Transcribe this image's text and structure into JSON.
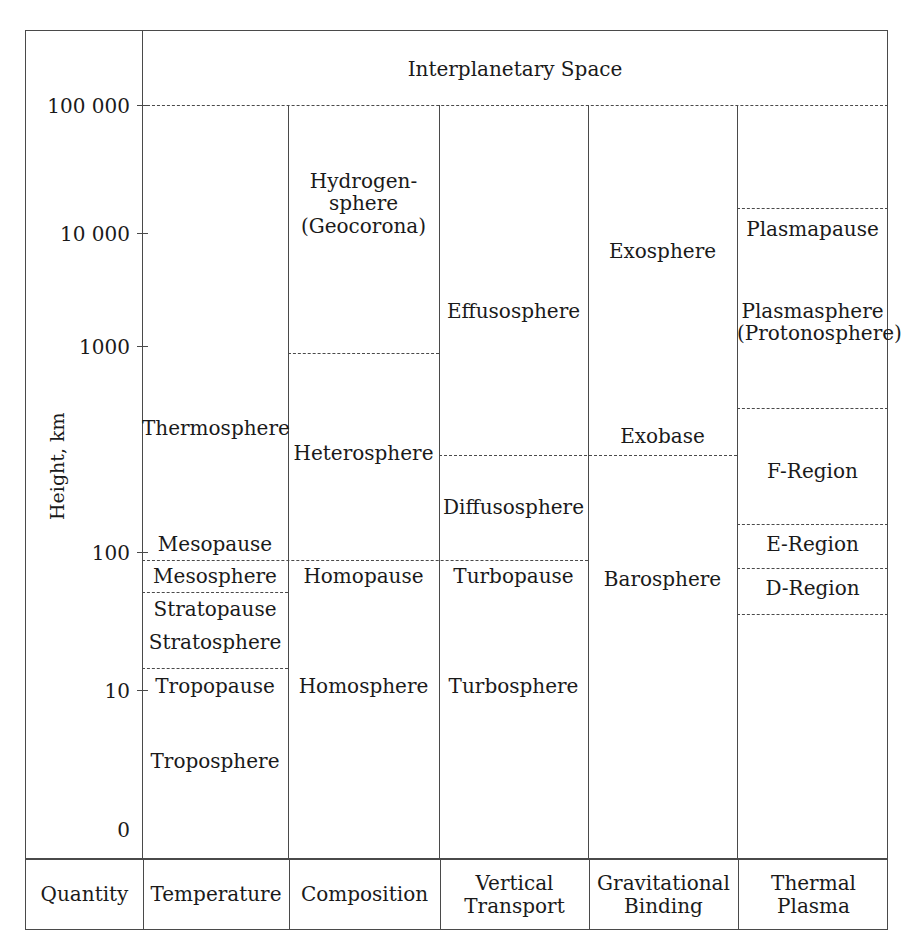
{
  "figure": {
    "axis_title": "Height, km",
    "top_banner": "Interplanetary Space"
  },
  "axis": {
    "ticks": [
      {
        "label": "100 000",
        "value": 100000
      },
      {
        "label": "10 000",
        "value": 10000
      },
      {
        "label": "1000",
        "value": 1000
      },
      {
        "label": "100",
        "value": 100
      },
      {
        "label": "10",
        "value": 10
      },
      {
        "label": "0",
        "value": 0
      }
    ]
  },
  "columns": [
    {
      "key": "quantity",
      "header": "Quantity"
    },
    {
      "key": "temperature",
      "header": "Temperature"
    },
    {
      "key": "composition",
      "header": "Composition"
    },
    {
      "key": "vertical_transport",
      "header": "Vertical\nTransport"
    },
    {
      "key": "gravitational_binding",
      "header": "Gravitational\nBinding"
    },
    {
      "key": "thermal_plasma",
      "header": "Thermal\nPlasma"
    }
  ],
  "regions": {
    "temperature": [
      {
        "label": "Thermosphere"
      },
      {
        "label": "Mesopause"
      },
      {
        "label": "Mesosphere"
      },
      {
        "label": "Stratopause"
      },
      {
        "label": "Stratosphere"
      },
      {
        "label": "Tropopause"
      },
      {
        "label": "Troposphere"
      }
    ],
    "composition": [
      {
        "label": "Hydrogen-\nsphere\n(Geocorona)"
      },
      {
        "label": "Heterosphere"
      },
      {
        "label": "Homopause"
      },
      {
        "label": "Homosphere"
      }
    ],
    "vertical_transport": [
      {
        "label": "Effusosphere"
      },
      {
        "label": "Diffusosphere"
      },
      {
        "label": "Turbopause"
      },
      {
        "label": "Turbosphere"
      }
    ],
    "gravitational_binding": [
      {
        "label": "Exosphere"
      },
      {
        "label": "Exobase"
      },
      {
        "label": "Barosphere"
      }
    ],
    "thermal_plasma": [
      {
        "label": "Plasmapause"
      },
      {
        "label": "Plasmasphere\n(Protonosphere)"
      },
      {
        "label": "F-Region"
      },
      {
        "label": "E-Region"
      },
      {
        "label": "D-Region"
      }
    ]
  }
}
